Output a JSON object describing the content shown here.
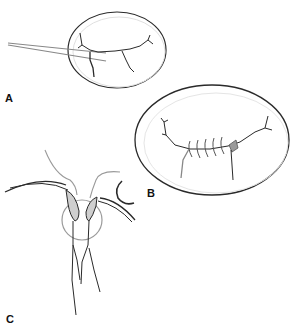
{
  "figure": {
    "panels": [
      {
        "id": "A",
        "label": "A",
        "description": "Oval structure with branching line, inserted forceps/probe instrument from left"
      },
      {
        "id": "B",
        "label": "B",
        "description": "Enlarged oval structure showing sutured line with five stitches and shaded node"
      },
      {
        "id": "C",
        "label": "C",
        "description": "Two curved instruments with shaded tips converging inside a circle, with small curved needle nearby"
      }
    ],
    "colors": {
      "outline": "#2a2a2a",
      "light_line": "#9a9a9a",
      "shade_fill": "#cfcfcf",
      "background": "#ffffff"
    }
  }
}
